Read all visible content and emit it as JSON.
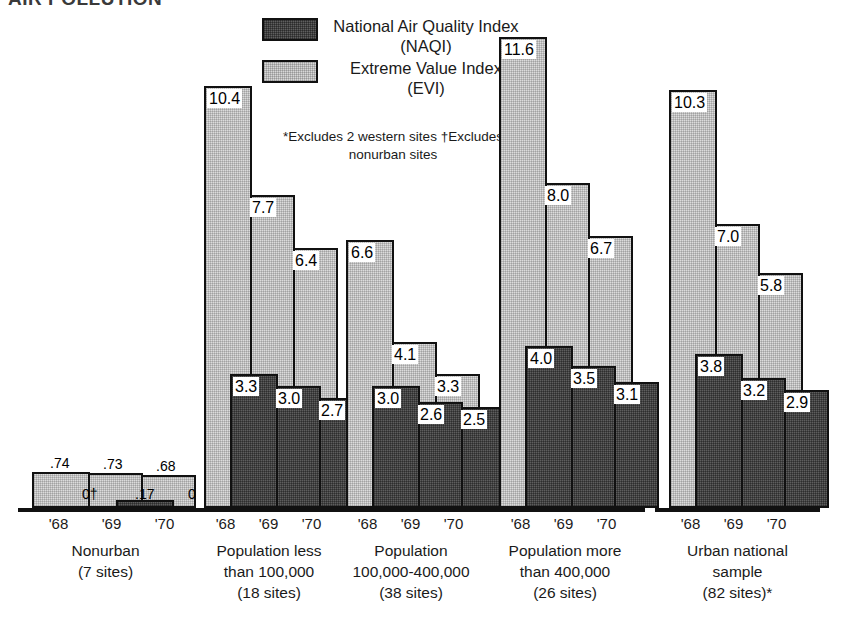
{
  "title": "AIR POLLUTION",
  "legend": {
    "items": [
      {
        "swatch": "naqi-swatch",
        "label": "National Air Quality\nIndex (NAQI)"
      },
      {
        "swatch": "evi-swatch",
        "label": "Extreme Value\nIndex (EVI)"
      }
    ]
  },
  "footnotes": "*Excludes 2 western sites\n†Excludes nonurban sites",
  "colors": {
    "naqi": "#5e5e5e",
    "evi": "#dcdcdc",
    "outline": "#111111",
    "background": "#ffffff"
  },
  "chart_data": {
    "type": "bar",
    "title": "AIR POLLUTION",
    "xlabel": "",
    "ylabel": "",
    "ylim": [
      0,
      12
    ],
    "grid": false,
    "legend_position": "top-center",
    "categories": [
      "'68",
      "'69",
      "'70"
    ],
    "groups": [
      {
        "name": "Nonurban",
        "caption": "Nonurban\n(7 sites)",
        "caption_line1": "Nonurban",
        "caption_line2": "(7 sites)",
        "sites": 7,
        "years": [
          "'68",
          "'69",
          "'70"
        ],
        "series": [
          {
            "name": "National Air Quality Index (NAQI)",
            "values": [
              0,
              0.17,
              0
            ],
            "labels": [
              "0†",
              ".17",
              "0"
            ]
          },
          {
            "name": "Extreme Value Index (EVI)",
            "values": [
              0.74,
              0.73,
              0.68
            ],
            "labels": [
              ".74",
              ".73",
              ".68"
            ]
          }
        ]
      },
      {
        "name": "Population less than 100,000",
        "caption": "Population less\nthan 100,000\n(18 sites)",
        "caption_line1": "Population less",
        "caption_line2": "than 100,000",
        "caption_line3": "(18 sites)",
        "sites": 18,
        "years": [
          "'68",
          "'69",
          "'70"
        ],
        "series": [
          {
            "name": "National Air Quality Index (NAQI)",
            "values": [
              3.3,
              3.0,
              2.7
            ],
            "labels": [
              "3.3",
              "3.0",
              "2.7"
            ]
          },
          {
            "name": "Extreme Value Index (EVI)",
            "values": [
              10.4,
              7.7,
              6.4
            ],
            "labels": [
              "10.4",
              "7.7",
              "6.4"
            ]
          }
        ]
      },
      {
        "name": "Population 100,000-400,000",
        "caption": "Population\n100,000-400,000\n(38 sites)",
        "caption_line1": "Population",
        "caption_line2": "100,000-400,000",
        "caption_line3": "(38 sites)",
        "sites": 38,
        "years": [
          "'68",
          "'69",
          "'70"
        ],
        "series": [
          {
            "name": "National Air Quality Index (NAQI)",
            "values": [
              3.0,
              2.6,
              2.5
            ],
            "labels": [
              "3.0",
              "2.6",
              "2.5"
            ]
          },
          {
            "name": "Extreme Value Index (EVI)",
            "values": [
              6.6,
              4.1,
              3.3
            ],
            "labels": [
              "6.6",
              "4.1",
              "3.3"
            ]
          }
        ]
      },
      {
        "name": "Population more than 400,000",
        "caption": "Population more\nthan 400,000\n(26 sites)",
        "caption_line1": "Population more",
        "caption_line2": "than 400,000",
        "caption_line3": "(26 sites)",
        "sites": 26,
        "years": [
          "'68",
          "'69",
          "'70"
        ],
        "series": [
          {
            "name": "National Air Quality Index (NAQI)",
            "values": [
              4.0,
              3.5,
              3.1
            ],
            "labels": [
              "4.0",
              "3.5",
              "3.1"
            ]
          },
          {
            "name": "Extreme Value Index (EVI)",
            "values": [
              11.6,
              8.0,
              6.7
            ],
            "labels": [
              "11.6",
              "8.0",
              "6.7"
            ]
          }
        ]
      },
      {
        "name": "Urban national sample",
        "caption": "Urban national\nsample\n(82 sites)*",
        "caption_line1": "Urban national",
        "caption_line2": "sample",
        "caption_line3": "(82 sites)*",
        "sites": 82,
        "years": [
          "'68",
          "'69",
          "'70"
        ],
        "series": [
          {
            "name": "National Air Quality Index (NAQI)",
            "values": [
              3.8,
              3.2,
              2.9
            ],
            "labels": [
              "3.8",
              "3.2",
              "2.9"
            ]
          },
          {
            "name": "Extreme Value Index (EVI)",
            "values": [
              10.3,
              7.0,
              5.8
            ],
            "labels": [
              "10.3",
              "7.0",
              "5.8"
            ]
          }
        ]
      }
    ]
  }
}
